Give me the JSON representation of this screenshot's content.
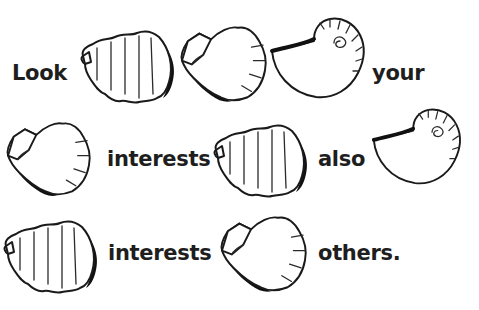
{
  "rebus": {
    "background": "#ffffff",
    "text_color": "#1e1e1e",
    "row1": {
      "word1": "Look",
      "shells": [
        "side-scallop",
        "fan-scallop",
        "nautilus"
      ],
      "word2": "your"
    },
    "row2": {
      "shells_before": [
        "fan-scallop"
      ],
      "word1": "interests",
      "shells_mid": [
        "side-scallop"
      ],
      "word2": "also",
      "shells_after": [
        "nautilus"
      ]
    },
    "row3": {
      "shells_before": [
        "side-scallop"
      ],
      "word1": "interests",
      "shells_mid": [
        "fan-scallop"
      ],
      "word2": "others."
    }
  }
}
